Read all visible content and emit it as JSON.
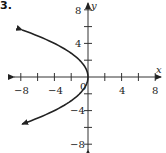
{
  "problem_number": "3.",
  "chart_data": {
    "type": "line",
    "title": "",
    "xlabel": "x",
    "ylabel": "y",
    "xlim": [
      -8,
      8
    ],
    "ylim": [
      -8,
      8
    ],
    "x_tick_labels": [
      "−8",
      "−4",
      "4",
      "8"
    ],
    "y_tick_labels": [
      "8",
      "4",
      "−4",
      "−8"
    ],
    "origin_label": "0",
    "tick_step": 2,
    "grid": false,
    "legend": null,
    "series": [
      {
        "name": "parabola x = -y²/4",
        "equation": "y^2 = -4x",
        "orientation": "opens left",
        "vertex": [
          0,
          0
        ],
        "points": [
          {
            "x": -7.84,
            "y": 5.6
          },
          {
            "x": -4,
            "y": 4
          },
          {
            "x": -1,
            "y": 2
          },
          {
            "x": 0,
            "y": 0
          },
          {
            "x": -1,
            "y": -2
          },
          {
            "x": -4,
            "y": -4
          },
          {
            "x": -7.84,
            "y": -5.6
          }
        ],
        "arrows_at_ends": true,
        "color": "#222222"
      }
    ]
  }
}
